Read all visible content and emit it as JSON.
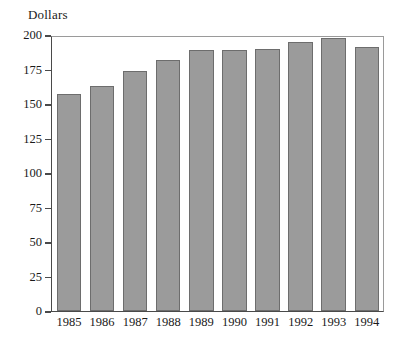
{
  "chart_data": {
    "type": "bar",
    "title": "",
    "subtitle": "",
    "xlabel": "",
    "ylabel": "Dollars",
    "categories": [
      "1985",
      "1986",
      "1987",
      "1988",
      "1989",
      "1990",
      "1991",
      "1992",
      "1993",
      "1994"
    ],
    "values": [
      157,
      163,
      174,
      182,
      189,
      189,
      190,
      195,
      198,
      191
    ],
    "ylim": [
      0,
      200
    ],
    "yticks": [
      0,
      25,
      50,
      75,
      100,
      125,
      150,
      175,
      200
    ],
    "ytick_labels": [
      "0",
      "25",
      "50",
      "75",
      "100",
      "125",
      "150",
      "175",
      "200"
    ],
    "grid": false,
    "legend": null,
    "legend_position": "none",
    "bar_fill_color": "#9b9b9b",
    "bar_edge_color": "#6d6d6d",
    "axis_color": "#4a4a4a",
    "background_color": "#ffffff"
  }
}
